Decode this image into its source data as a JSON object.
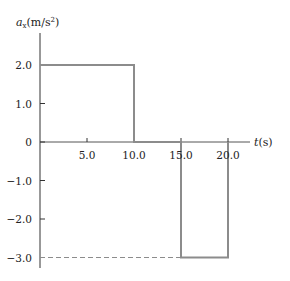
{
  "chart_data": {
    "type": "line",
    "title": "",
    "xlabel": "t(s)",
    "ylabel": "a_x(m/s^2)",
    "ylabel_parts": {
      "symbol": "a",
      "subscript": "x",
      "unit": "(m/s",
      "sup": "2",
      "close": ")"
    },
    "xlabel_parts": {
      "symbol": "t",
      "unit": "(s)"
    },
    "xlim": [
      0,
      22.5
    ],
    "ylim": [
      -3.5,
      3.0
    ],
    "grid": false,
    "x_ticks": [
      5.0,
      10.0,
      15.0,
      20.0
    ],
    "x_tick_labels": [
      "5.0",
      "10.0",
      "15.0",
      "20.0"
    ],
    "y_ticks": [
      2.0,
      1.0,
      0,
      -1.0,
      -2.0,
      -3.0
    ],
    "y_tick_labels": [
      "2.0",
      "1.0",
      "0",
      "-1.0",
      "-2.0",
      "-3.0"
    ],
    "series": [
      {
        "name": "a_x(t)",
        "style": "step",
        "color": "#8c8c8c",
        "x": [
          0,
          10.0,
          10.0,
          15.0,
          15.0,
          20.0,
          20.0
        ],
        "y": [
          2.0,
          2.0,
          0,
          0,
          -3.0,
          -3.0,
          0
        ]
      }
    ],
    "annotations": [
      {
        "type": "dashed-guide",
        "from": [
          0,
          -3.0
        ],
        "to": [
          15.0,
          -3.0
        ],
        "color": "#8c8c8c"
      }
    ],
    "segments_summary": [
      {
        "t_start": 0,
        "t_end": 10.0,
        "a_x": 2.0
      },
      {
        "t_start": 10.0,
        "t_end": 15.0,
        "a_x": 0
      },
      {
        "t_start": 15.0,
        "t_end": 20.0,
        "a_x": -3.0
      }
    ]
  },
  "colors": {
    "axis": "#333333",
    "series": "#8c8c8c",
    "text": "#222222"
  }
}
